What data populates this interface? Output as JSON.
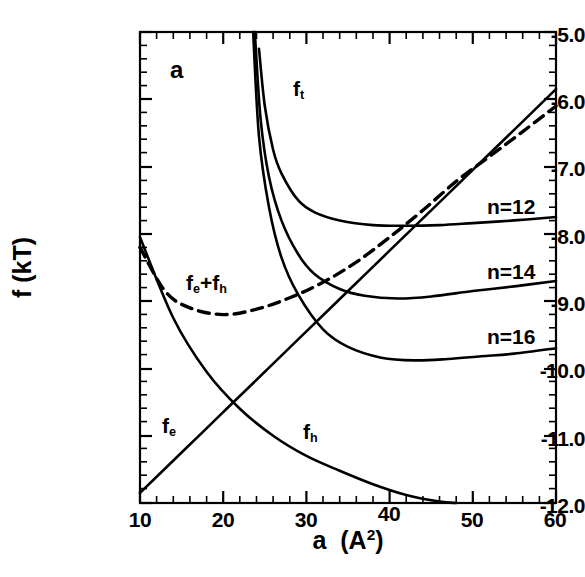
{
  "panel": {
    "label": "a"
  },
  "axes": {
    "ylabel_text": "f  (kT)",
    "xlabel_a": "a",
    "xlabel_unit_open": "(A",
    "xlabel_unit_exp": "2",
    "xlabel_unit_close": ")",
    "yticks": [
      "-5.0",
      "-6.0",
      "-7.0",
      "-8.0",
      "-9.0",
      "-10.0",
      "-11.0",
      "-12.0"
    ],
    "xticks": [
      "10",
      "20",
      "30",
      "40",
      "50",
      "60"
    ]
  },
  "annotations": {
    "ft": "f",
    "ft_sub": "t",
    "fe_plus_fh_1": "f",
    "fe_plus_fh_sub1": "e",
    "fe_plus_fh_mid": "+f",
    "fe_plus_fh_sub2": "h",
    "fe": "f",
    "fe_sub": "e",
    "fh": "f",
    "fh_sub": "h",
    "n12": "n=12",
    "n14": "n=14",
    "n16": "n=16"
  },
  "chart_data": {
    "type": "line",
    "title": "",
    "xlabel": "a (A^2)",
    "ylabel": "f (kT)",
    "xlim": [
      10,
      60
    ],
    "ylim": [
      -12.0,
      -5.0
    ],
    "xticks": [
      10,
      20,
      30,
      40,
      50,
      60
    ],
    "yticks": [
      -12.0,
      -11.0,
      -10.0,
      -9.0,
      -8.0,
      -7.0,
      -6.0,
      -5.0
    ],
    "xminor_step": 2,
    "yminor_step": 0.2,
    "grid": false,
    "legend": "none (curves labelled inline)",
    "panel_label": "a",
    "series": [
      {
        "name": "f_e",
        "label": "f_e",
        "style": "solid",
        "comment": "straight rising line, electrostatic/interfacial term",
        "x": [
          10,
          15,
          20,
          25,
          30,
          35,
          40,
          45,
          50,
          55,
          60
        ],
        "y": [
          -11.85,
          -11.25,
          -10.65,
          -10.05,
          -9.45,
          -8.85,
          -8.25,
          -7.65,
          -7.05,
          -6.45,
          -5.85
        ]
      },
      {
        "name": "f_h",
        "label": "f_h",
        "style": "solid",
        "comment": "monotonically decreasing convex curve, headgroup term",
        "x": [
          10,
          14,
          18,
          22,
          26,
          30,
          34,
          38,
          42,
          46,
          48
        ],
        "y": [
          -8.05,
          -9.25,
          -10.05,
          -10.6,
          -11.0,
          -11.3,
          -11.52,
          -11.72,
          -11.88,
          -11.98,
          -12.0
        ]
      },
      {
        "name": "f_e+f_h",
        "label": "f_e+f_h",
        "style": "dashed",
        "comment": "sum of f_e and f_h; shallow minimum near a = 20",
        "x": [
          10,
          13,
          16,
          20,
          24,
          28,
          32,
          36,
          40,
          44,
          48,
          52,
          56,
          60
        ],
        "y": [
          -8.2,
          -8.85,
          -9.1,
          -9.2,
          -9.12,
          -8.95,
          -8.72,
          -8.42,
          -8.05,
          -7.65,
          -7.22,
          -6.85,
          -6.48,
          -6.1
        ]
      },
      {
        "name": "f_t n=12",
        "label": "n=12",
        "style": "solid",
        "comment": "total free energy for chain length n=12; steep rise at small a, flat tail",
        "x": [
          24.3,
          25,
          26,
          27,
          29,
          31,
          34,
          38,
          42,
          46,
          50,
          55,
          60
        ],
        "y": [
          -5.25,
          -6.1,
          -6.75,
          -7.1,
          -7.5,
          -7.68,
          -7.8,
          -7.87,
          -7.88,
          -7.87,
          -7.84,
          -7.8,
          -7.75
        ]
      },
      {
        "name": "f_t n=14",
        "label": "n=14",
        "style": "solid",
        "comment": "total free energy for chain length n=14",
        "x": [
          23.8,
          24.5,
          25.5,
          27,
          29,
          31,
          34,
          37,
          41,
          45,
          50,
          55,
          60
        ],
        "y": [
          -5.0,
          -6.3,
          -7.15,
          -7.8,
          -8.3,
          -8.6,
          -8.82,
          -8.92,
          -8.96,
          -8.93,
          -8.85,
          -8.78,
          -8.7
        ]
      },
      {
        "name": "f_t n=16",
        "label": "n=16",
        "style": "solid",
        "comment": "total free energy for chain length n=16; lowest minimum",
        "x": [
          23.6,
          24.3,
          25.5,
          27,
          29,
          32,
          35,
          39,
          43,
          47,
          51,
          55,
          60
        ],
        "y": [
          -5.0,
          -6.55,
          -7.6,
          -8.35,
          -8.9,
          -9.42,
          -9.68,
          -9.84,
          -9.88,
          -9.86,
          -9.82,
          -9.78,
          -9.7
        ]
      }
    ]
  }
}
